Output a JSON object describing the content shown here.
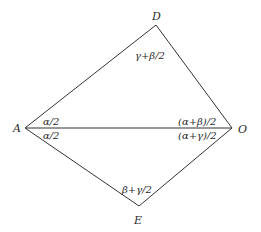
{
  "diagram": {
    "type": "geometry",
    "vertices": {
      "A": {
        "label": "A",
        "x": 25,
        "y": 128
      },
      "O": {
        "label": "O",
        "x": 232,
        "y": 128
      },
      "D": {
        "label": "D",
        "x": 156,
        "y": 25
      },
      "E": {
        "label": "E",
        "x": 139,
        "y": 206
      }
    },
    "edges": [
      [
        "A",
        "D"
      ],
      [
        "D",
        "O"
      ],
      [
        "A",
        "O"
      ],
      [
        "A",
        "E"
      ],
      [
        "E",
        "O"
      ]
    ],
    "angle_labels": {
      "D": "γ+β/2",
      "A_upper": "α/2",
      "A_lower": "α/2",
      "O_upper": "(α+β)/2",
      "O_lower": "(α+γ)/2",
      "E": "β+γ/2"
    },
    "colors": {
      "line": "#333333",
      "text": "#2a2a2a",
      "background": "#ffffff"
    }
  }
}
